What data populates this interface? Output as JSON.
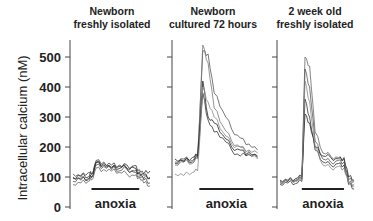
{
  "chart_data": {
    "type": "line",
    "ylabel": "Intracellular calcium (nM)",
    "ylim": [
      0,
      550
    ],
    "yticks": [
      0,
      100,
      200,
      300,
      400,
      500
    ],
    "ytick_labels": [
      "0",
      "100",
      "200",
      "300",
      "400",
      "500"
    ],
    "grid": false,
    "legend": "none",
    "panels": [
      {
        "title_lines": [
          "Newborn",
          "freshly isolated"
        ],
        "annotation": "anoxia",
        "anoxia_window": [
          0.24,
          0.86
        ],
        "series": [
          {
            "name": "trace 1",
            "color": "#333333",
            "t": [
              0,
              0.1,
              0.2,
              0.24,
              0.3,
              0.4,
              0.5,
              0.6,
              0.7,
              0.8,
              0.86,
              0.92,
              1
            ],
            "values": [
              95,
              105,
              100,
              110,
              150,
              145,
              140,
              135,
              130,
              138,
              125,
              110,
              120
            ]
          },
          {
            "name": "trace 2",
            "color": "#555555",
            "t": [
              0,
              0.1,
              0.2,
              0.24,
              0.3,
              0.4,
              0.5,
              0.6,
              0.7,
              0.8,
              0.86,
              0.92,
              1
            ],
            "values": [
              85,
              95,
              90,
              100,
              140,
              135,
              130,
              120,
              128,
              115,
              105,
              95,
              100
            ]
          },
          {
            "name": "trace 3",
            "color": "#444444",
            "t": [
              0,
              0.1,
              0.2,
              0.24,
              0.3,
              0.4,
              0.5,
              0.6,
              0.7,
              0.8,
              0.86,
              0.92,
              1
            ],
            "values": [
              110,
              100,
              115,
              108,
              155,
              150,
              125,
              140,
              125,
              120,
              118,
              90,
              80
            ]
          },
          {
            "name": "trace 4",
            "color": "#666666",
            "t": [
              0,
              0.1,
              0.2,
              0.24,
              0.3,
              0.4,
              0.5,
              0.6,
              0.7,
              0.8,
              0.86,
              0.92,
              1
            ],
            "values": [
              75,
              80,
              85,
              90,
              130,
              125,
              120,
              115,
              110,
              105,
              100,
              80,
              70
            ]
          },
          {
            "name": "trace 5",
            "color": "#222222",
            "t": [
              0,
              0.1,
              0.2,
              0.24,
              0.3,
              0.4,
              0.5,
              0.6,
              0.7,
              0.8,
              0.86,
              0.92,
              1
            ],
            "values": [
              100,
              90,
              95,
              98,
              148,
              140,
              132,
              128,
              140,
              130,
              112,
              105,
              95
            ]
          }
        ]
      },
      {
        "title_lines": [
          "Newborn",
          "cultured 72 hours"
        ],
        "annotation": "anoxia",
        "anoxia_window": [
          0.28,
          0.9
        ],
        "series": [
          {
            "name": "trace 1",
            "color": "#555555",
            "t": [
              0,
              0.1,
              0.2,
              0.26,
              0.32,
              0.38,
              0.45,
              0.55,
              0.65,
              0.75,
              0.85,
              0.95
            ],
            "values": [
              150,
              160,
              155,
              170,
              520,
              510,
              380,
              320,
              260,
              230,
              210,
              190
            ]
          },
          {
            "name": "trace 2",
            "color": "#777777",
            "t": [
              0,
              0.1,
              0.2,
              0.26,
              0.32,
              0.38,
              0.45,
              0.55,
              0.65,
              0.75,
              0.85,
              0.95
            ],
            "values": [
              140,
              150,
              145,
              160,
              540,
              480,
              330,
              270,
              220,
              200,
              190,
              180
            ]
          },
          {
            "name": "trace 3",
            "color": "#222222",
            "t": [
              0,
              0.1,
              0.2,
              0.26,
              0.32,
              0.38,
              0.45,
              0.55,
              0.65,
              0.75,
              0.85,
              0.95
            ],
            "values": [
              160,
              150,
              165,
              170,
              420,
              300,
              280,
              240,
              200,
              190,
              175,
              170
            ]
          },
          {
            "name": "trace 4",
            "color": "#333333",
            "t": [
              0,
              0.1,
              0.2,
              0.26,
              0.32,
              0.38,
              0.45,
              0.55,
              0.65,
              0.75,
              0.85,
              0.95
            ],
            "values": [
              145,
              155,
              150,
              165,
              380,
              290,
              250,
              230,
              190,
              170,
              185,
              165
            ]
          },
          {
            "name": "trace 5",
            "color": "#888888",
            "t": [
              0,
              0.1,
              0.2,
              0.26,
              0.32,
              0.38,
              0.45,
              0.55,
              0.65,
              0.75,
              0.85,
              0.95
            ],
            "values": [
              110,
              105,
              115,
              120,
              400,
              350,
              300,
              250,
              210,
              200,
              180,
              160
            ]
          }
        ]
      },
      {
        "title_lines": [
          "2 week old",
          "freshly isolated"
        ],
        "annotation": "anoxia",
        "anoxia_window": [
          0.28,
          0.82
        ],
        "series": [
          {
            "name": "trace 1",
            "color": "#666666",
            "t": [
              0,
              0.1,
              0.2,
              0.28,
              0.32,
              0.38,
              0.45,
              0.55,
              0.65,
              0.75,
              0.82,
              0.88,
              0.95
            ],
            "values": [
              80,
              85,
              90,
              95,
              500,
              470,
              250,
              180,
              170,
              165,
              160,
              80,
              70
            ]
          },
          {
            "name": "trace 2",
            "color": "#555555",
            "t": [
              0,
              0.1,
              0.2,
              0.28,
              0.32,
              0.38,
              0.45,
              0.55,
              0.65,
              0.75,
              0.82,
              0.88,
              0.95
            ],
            "values": [
              85,
              90,
              88,
              92,
              460,
              400,
              220,
              160,
              150,
              155,
              150,
              90,
              85
            ]
          },
          {
            "name": "trace 3",
            "color": "#222222",
            "t": [
              0,
              0.1,
              0.2,
              0.28,
              0.32,
              0.38,
              0.45,
              0.55,
              0.65,
              0.75,
              0.82,
              0.88,
              0.95
            ],
            "values": [
              90,
              85,
              95,
              100,
              310,
              280,
              200,
              170,
              165,
              160,
              165,
              100,
              90
            ]
          },
          {
            "name": "trace 4",
            "color": "#333333",
            "t": [
              0,
              0.1,
              0.2,
              0.28,
              0.32,
              0.38,
              0.45,
              0.55,
              0.65,
              0.75,
              0.82,
              0.88,
              0.95
            ],
            "values": [
              75,
              80,
              78,
              85,
              360,
              300,
              190,
              150,
              140,
              145,
              140,
              75,
              60
            ]
          },
          {
            "name": "trace 5",
            "color": "#888888",
            "t": [
              0,
              0.1,
              0.2,
              0.28,
              0.32,
              0.38,
              0.45,
              0.55,
              0.65,
              0.75,
              0.82,
              0.88,
              0.95
            ],
            "values": [
              82,
              88,
              85,
              90,
              420,
              350,
              200,
              140,
              130,
              135,
              130,
              80,
              75
            ]
          }
        ]
      }
    ]
  }
}
